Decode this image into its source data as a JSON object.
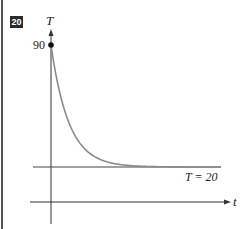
{
  "problem_number": "20",
  "chart_data": {
    "type": "line",
    "title": "",
    "xlabel": "t",
    "ylabel": "T",
    "initial_value": 90,
    "initial_value_label": "90",
    "asymptote": 20,
    "asymptote_label": "T = 20",
    "series": [
      {
        "name": "T(t)",
        "function": "20 + 70*exp(-k t)",
        "x": [
          0,
          0.5,
          1,
          1.5,
          2,
          3,
          4,
          5,
          6,
          7,
          8
        ],
        "values": [
          90,
          62.5,
          45.8,
          35.6,
          29.5,
          23.5,
          21.3,
          20.5,
          20.2,
          20.1,
          20.0
        ]
      }
    ],
    "colors": {
      "curve": "#8a8a8a",
      "axes": "#333333"
    }
  }
}
